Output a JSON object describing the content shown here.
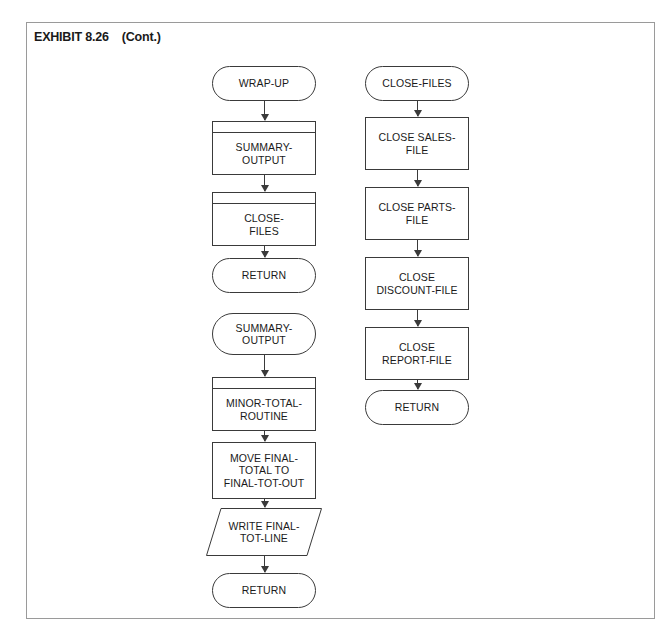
{
  "exhibit": {
    "title": "EXHIBIT 8.26    (Cont.)",
    "frame_color": "#9a9a9a",
    "line_color": "#3a3a3a",
    "background": "#ffffff"
  },
  "flowcharts": [
    {
      "id": "wrap-up",
      "column": "left",
      "nodes": [
        {
          "id": "wrap-up-start",
          "label": "WRAP-UP",
          "shape": "terminal",
          "x": 212,
          "y": 66,
          "w": 104,
          "h": 35
        },
        {
          "id": "summary-output-call",
          "label": "SUMMARY-\nOUTPUT",
          "shape": "subroutine",
          "x": 212,
          "y": 121,
          "w": 104,
          "h": 54
        },
        {
          "id": "close-files-call",
          "label": "CLOSE-\nFILES",
          "shape": "subroutine",
          "x": 212,
          "y": 192,
          "w": 104,
          "h": 54
        },
        {
          "id": "wrap-up-return",
          "label": "RETURN",
          "shape": "terminal",
          "x": 212,
          "y": 258,
          "w": 104,
          "h": 35
        }
      ],
      "connectors": [
        {
          "from": "wrap-up-start",
          "to": "summary-output-call"
        },
        {
          "from": "summary-output-call",
          "to": "close-files-call"
        },
        {
          "from": "close-files-call",
          "to": "wrap-up-return"
        }
      ]
    },
    {
      "id": "summary-output",
      "column": "left",
      "nodes": [
        {
          "id": "summary-output-start",
          "label": "SUMMARY-\nOUTPUT",
          "shape": "terminal",
          "x": 212,
          "y": 313,
          "w": 104,
          "h": 42
        },
        {
          "id": "minor-total-routine",
          "label": "MINOR-TOTAL-\nROUTINE",
          "shape": "subroutine",
          "x": 212,
          "y": 377,
          "w": 104,
          "h": 54
        },
        {
          "id": "move-final-total",
          "label": "MOVE FINAL-\nTOTAL TO\nFINAL-TOT-OUT",
          "shape": "process",
          "x": 212,
          "y": 442,
          "w": 104,
          "h": 57
        },
        {
          "id": "write-final-tot-line",
          "label": "WRITE FINAL-\nTOT-LINE",
          "shape": "io",
          "x": 206,
          "y": 508,
          "w": 116,
          "h": 48
        },
        {
          "id": "summary-output-return",
          "label": "RETURN",
          "shape": "terminal",
          "x": 212,
          "y": 573,
          "w": 104,
          "h": 35
        }
      ],
      "connectors": [
        {
          "from": "summary-output-start",
          "to": "minor-total-routine"
        },
        {
          "from": "minor-total-routine",
          "to": "move-final-total"
        },
        {
          "from": "move-final-total",
          "to": "write-final-tot-line"
        },
        {
          "from": "write-final-tot-line",
          "to": "summary-output-return"
        }
      ]
    },
    {
      "id": "close-files",
      "column": "right",
      "nodes": [
        {
          "id": "close-files-start",
          "label": "CLOSE-FILES",
          "shape": "terminal",
          "x": 365,
          "y": 66,
          "w": 104,
          "h": 35
        },
        {
          "id": "close-sales-file",
          "label": "CLOSE SALES-\nFILE",
          "shape": "process",
          "x": 365,
          "y": 117,
          "w": 104,
          "h": 53
        },
        {
          "id": "close-parts-file",
          "label": "CLOSE PARTS-\nFILE",
          "shape": "process",
          "x": 365,
          "y": 187,
          "w": 104,
          "h": 53
        },
        {
          "id": "close-discount-file",
          "label": "CLOSE\nDISCOUNT-FILE",
          "shape": "process",
          "x": 365,
          "y": 257,
          "w": 104,
          "h": 53
        },
        {
          "id": "close-report-file",
          "label": "CLOSE\nREPORT-FILE",
          "shape": "process",
          "x": 365,
          "y": 327,
          "w": 104,
          "h": 53
        },
        {
          "id": "close-files-return",
          "label": "RETURN",
          "shape": "terminal",
          "x": 365,
          "y": 390,
          "w": 104,
          "h": 35
        }
      ],
      "connectors": [
        {
          "from": "close-files-start",
          "to": "close-sales-file"
        },
        {
          "from": "close-sales-file",
          "to": "close-parts-file"
        },
        {
          "from": "close-parts-file",
          "to": "close-discount-file"
        },
        {
          "from": "close-discount-file",
          "to": "close-report-file"
        },
        {
          "from": "close-report-file",
          "to": "close-files-return"
        }
      ]
    }
  ]
}
